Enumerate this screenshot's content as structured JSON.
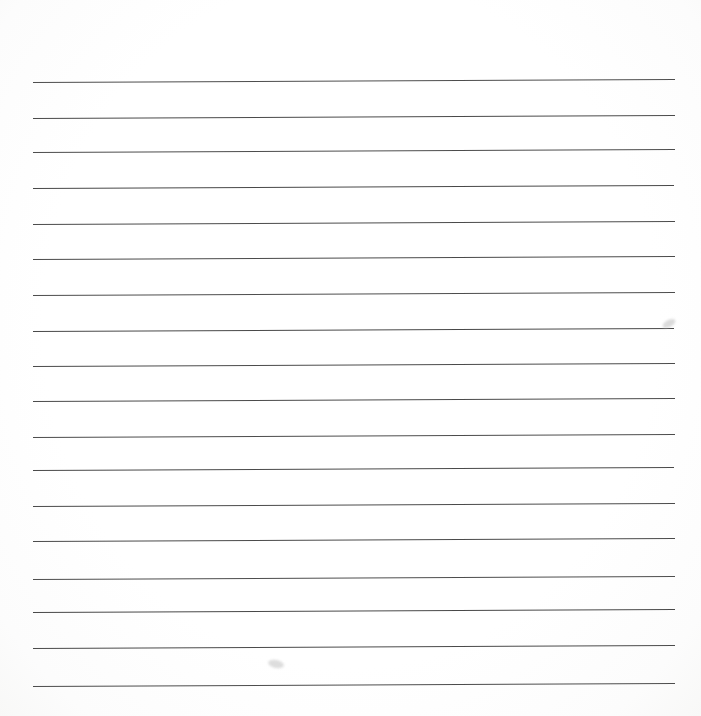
{
  "page": {
    "kind": "ruled-notebook-paper",
    "width": 701,
    "height": 716,
    "background_color": "#fefefe",
    "title": "Blank ruled paper",
    "written_text": "",
    "header_space_height": 82
  },
  "rules": {
    "count": 18,
    "color": "#4a4a4a",
    "thickness": 1.6,
    "left_margin": 33,
    "right_margin": 26,
    "line_length": 642,
    "first_line_y": 82,
    "last_line_y": 686,
    "spacing": 35.5,
    "tilt_degrees": -0.27,
    "lines": [
      {
        "index": 1,
        "y": 82.0,
        "x1": 33,
        "x2": 675,
        "color": "#4d4d4d",
        "thickness": 1.8
      },
      {
        "index": 2,
        "y": 117.5,
        "x1": 33,
        "x2": 675,
        "color": "#4a4a4a",
        "thickness": 1.7
      },
      {
        "index": 3,
        "y": 152.0,
        "x1": 33,
        "x2": 675,
        "color": "#4c4c4c",
        "thickness": 1.6
      },
      {
        "index": 4,
        "y": 188.0,
        "x1": 33,
        "x2": 674,
        "color": "#484848",
        "thickness": 1.7
      },
      {
        "index": 5,
        "y": 223.5,
        "x1": 33,
        "x2": 675,
        "color": "#4b4b4b",
        "thickness": 1.6
      },
      {
        "index": 6,
        "y": 259.0,
        "x1": 33,
        "x2": 675,
        "color": "#4a4a4a",
        "thickness": 1.7
      },
      {
        "index": 7,
        "y": 295.0,
        "x1": 33,
        "x2": 675,
        "color": "#4d4d4d",
        "thickness": 1.6
      },
      {
        "index": 8,
        "y": 330.5,
        "x1": 33,
        "x2": 674,
        "color": "#484848",
        "thickness": 1.7
      },
      {
        "index": 9,
        "y": 366.0,
        "x1": 33,
        "x2": 675,
        "color": "#4b4b4b",
        "thickness": 1.6
      },
      {
        "index": 10,
        "y": 401.0,
        "x1": 33,
        "x2": 675,
        "color": "#4a4a4a",
        "thickness": 1.7
      },
      {
        "index": 11,
        "y": 436.5,
        "x1": 33,
        "x2": 675,
        "color": "#4c4c4c",
        "thickness": 1.6
      },
      {
        "index": 12,
        "y": 470.0,
        "x1": 33,
        "x2": 674,
        "color": "#494949",
        "thickness": 1.7
      },
      {
        "index": 13,
        "y": 505.5,
        "x1": 33,
        "x2": 675,
        "color": "#4b4b4b",
        "thickness": 1.6
      },
      {
        "index": 14,
        "y": 541.0,
        "x1": 33,
        "x2": 675,
        "color": "#4a4a4a",
        "thickness": 1.7
      },
      {
        "index": 15,
        "y": 578.5,
        "x1": 33,
        "x2": 675,
        "color": "#4d4d4d",
        "thickness": 1.7
      },
      {
        "index": 16,
        "y": 612.0,
        "x1": 33,
        "x2": 675,
        "color": "#484848",
        "thickness": 1.7
      },
      {
        "index": 17,
        "y": 648.0,
        "x1": 33,
        "x2": 675,
        "color": "#4a4a4a",
        "thickness": 1.8
      },
      {
        "index": 18,
        "y": 686.0,
        "x1": 33,
        "x2": 675,
        "color": "#4c4c4c",
        "thickness": 1.9
      }
    ]
  },
  "marks": [
    {
      "name": "smudge-upper-right",
      "x": 662,
      "y": 320,
      "width": 14,
      "height": 7,
      "color": "#cfcfcf",
      "rotation": -28
    },
    {
      "name": "smudge-lower-left",
      "x": 268,
      "y": 660,
      "width": 16,
      "height": 8,
      "color": "#d2d2d2",
      "rotation": 12
    }
  ]
}
